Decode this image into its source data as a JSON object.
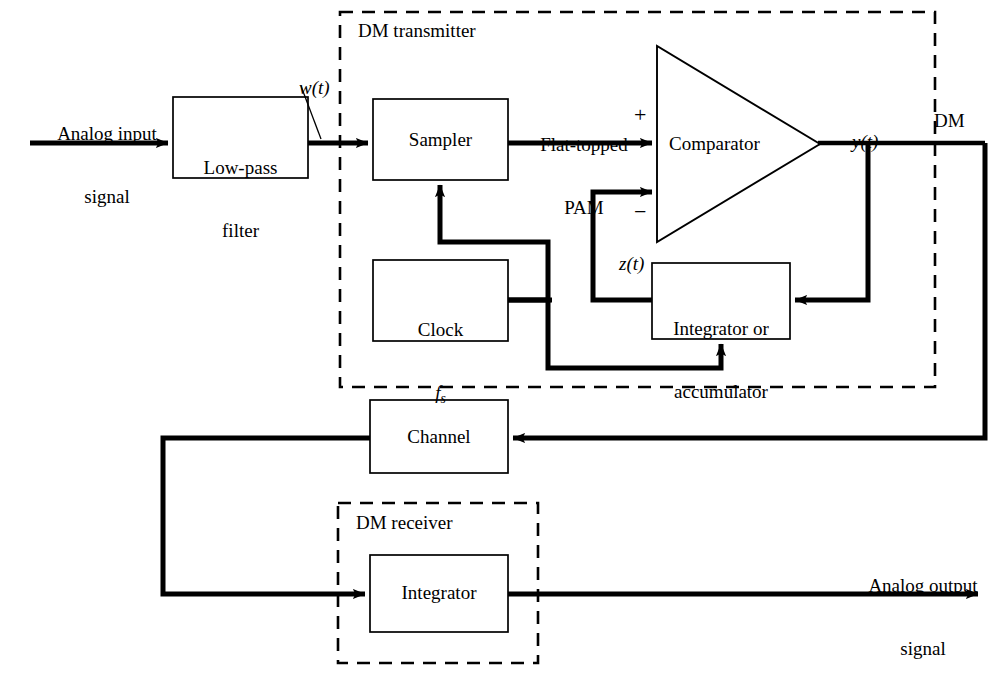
{
  "figure": {
    "stroke_color": "#000000",
    "background_color": "#ffffff"
  },
  "groups": {
    "transmitter_label": "DM transmitter",
    "receiver_label": "DM receiver"
  },
  "blocks": {
    "lowpass": {
      "line1": "Low-pass",
      "line2": "filter"
    },
    "sampler": {
      "line1": "Sampler"
    },
    "clock": {
      "line1": "Clock",
      "line2_var": "f",
      "line2_sub": "s"
    },
    "comparator": {
      "line1": "Comparator"
    },
    "integrator_acc": {
      "line1": "Integrator or",
      "line2": "accumulator"
    },
    "channel": {
      "line1": "Channel"
    },
    "receiver_integrator": {
      "line1": "Integrator"
    }
  },
  "signals": {
    "analog_in": {
      "line1": "Analog input",
      "line2": "signal"
    },
    "analog_out": {
      "line1": "Analog output",
      "line2": "signal"
    },
    "w_of_t": {
      "var": "w",
      "arg": "(t)"
    },
    "y_of_t": {
      "var": "y",
      "arg": "(t)"
    },
    "z_of_t": {
      "var": "z",
      "arg": "(t)"
    },
    "flat_topped": {
      "line1": "Flat-topped",
      "line2": "PAM"
    },
    "dm": "DM"
  },
  "polarity": {
    "plus": "+",
    "minus": "−"
  }
}
